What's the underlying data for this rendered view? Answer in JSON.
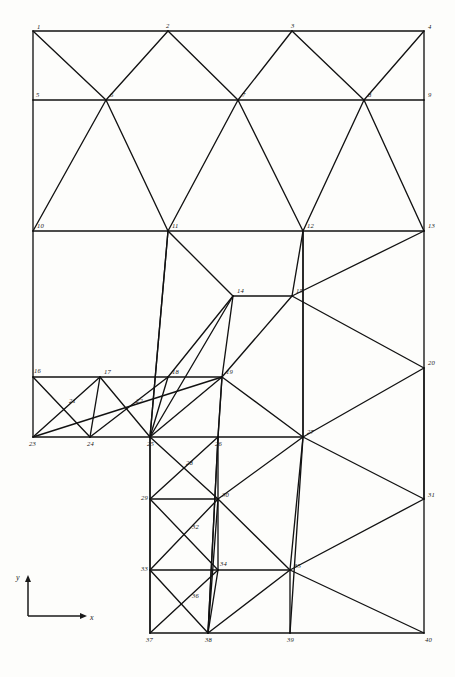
{
  "figure": {
    "kind": "finite-element-mesh-diagram",
    "line_color": "#121212",
    "label_color": "#151515",
    "background_color": "#fdfdfb",
    "canvas": {
      "width": 455,
      "height": 677
    }
  },
  "axes": {
    "origin": {
      "x": 28,
      "y": 616
    },
    "x_axis": {
      "label": "x",
      "tip_x": 86,
      "tip_y": 616
    },
    "y_axis": {
      "label": "y",
      "tip_x": 28,
      "tip_y": 576
    }
  },
  "nodes": [
    {
      "id": "1",
      "label": "1",
      "x": 33,
      "y": 31,
      "lx": 4,
      "ly": -2
    },
    {
      "id": "2",
      "label": "2",
      "x": 168,
      "y": 31,
      "lx": -2,
      "ly": -3
    },
    {
      "id": "3",
      "label": "3",
      "x": 292,
      "y": 31,
      "lx": -1,
      "ly": -3
    },
    {
      "id": "4",
      "label": "4",
      "x": 424,
      "y": 31,
      "lx": 4,
      "ly": -2
    },
    {
      "id": "5",
      "label": "5",
      "x": 33,
      "y": 100,
      "lx": 3,
      "ly": -3
    },
    {
      "id": "6",
      "label": "6",
      "x": 106,
      "y": 100,
      "lx": 4,
      "ly": -3
    },
    {
      "id": "7",
      "label": "7",
      "x": 238,
      "y": 100,
      "lx": 4,
      "ly": -3
    },
    {
      "id": "8",
      "label": "8",
      "x": 364,
      "y": 100,
      "lx": 4,
      "ly": -3
    },
    {
      "id": "9",
      "label": "9",
      "x": 424,
      "y": 100,
      "lx": 4,
      "ly": -3
    },
    {
      "id": "10",
      "label": "10",
      "x": 33,
      "y": 231,
      "lx": 4,
      "ly": -3
    },
    {
      "id": "11",
      "label": "11",
      "x": 168,
      "y": 231,
      "lx": 4,
      "ly": -3
    },
    {
      "id": "12",
      "label": "12",
      "x": 303,
      "y": 231,
      "lx": 4,
      "ly": -3
    },
    {
      "id": "13",
      "label": "13",
      "x": 424,
      "y": 231,
      "lx": 4,
      "ly": -3
    },
    {
      "id": "14",
      "label": "14",
      "x": 233,
      "y": 296,
      "lx": 4,
      "ly": -3
    },
    {
      "id": "15",
      "label": "15",
      "x": 292,
      "y": 296,
      "lx": 4,
      "ly": -3
    },
    {
      "id": "16",
      "label": "16",
      "x": 33,
      "y": 377,
      "lx": 1,
      "ly": -4
    },
    {
      "id": "17",
      "label": "17",
      "x": 100,
      "y": 377,
      "lx": 4,
      "ly": -3
    },
    {
      "id": "18",
      "label": "18",
      "x": 168,
      "y": 377,
      "lx": 4,
      "ly": -3
    },
    {
      "id": "19",
      "label": "19",
      "x": 222,
      "y": 377,
      "lx": 4,
      "ly": -3
    },
    {
      "id": "20",
      "label": "20",
      "x": 424,
      "y": 368,
      "lx": 4,
      "ly": -3
    },
    {
      "id": "21",
      "label": "21",
      "x": 67,
      "y": 406,
      "lx": 2,
      "ly": -3
    },
    {
      "id": "22",
      "label": "22",
      "x": 134,
      "y": 406,
      "lx": 2,
      "ly": -3
    },
    {
      "id": "23",
      "label": "23",
      "x": 33,
      "y": 437,
      "lx": -4,
      "ly": 9
    },
    {
      "id": "24",
      "label": "24",
      "x": 90,
      "y": 437,
      "lx": -3,
      "ly": 9
    },
    {
      "id": "25",
      "label": "25",
      "x": 150,
      "y": 437,
      "lx": -3,
      "ly": 9
    },
    {
      "id": "26",
      "label": "26",
      "x": 218,
      "y": 437,
      "lx": -3,
      "ly": 9
    },
    {
      "id": "27",
      "label": "27",
      "x": 303,
      "y": 437,
      "lx": 4,
      "ly": -3
    },
    {
      "id": "28",
      "label": "28",
      "x": 184,
      "y": 468,
      "lx": 2,
      "ly": -3
    },
    {
      "id": "29",
      "label": "29",
      "x": 150,
      "y": 499,
      "lx": -9,
      "ly": 1
    },
    {
      "id": "30",
      "label": "30",
      "x": 218,
      "y": 499,
      "lx": 4,
      "ly": -2
    },
    {
      "id": "31",
      "label": "31",
      "x": 424,
      "y": 499,
      "lx": 4,
      "ly": -2
    },
    {
      "id": "32",
      "label": "32",
      "x": 190,
      "y": 532,
      "lx": 2,
      "ly": -3
    },
    {
      "id": "33",
      "label": "33",
      "x": 150,
      "y": 570,
      "lx": -9,
      "ly": 1
    },
    {
      "id": "34",
      "label": "34",
      "x": 218,
      "y": 570,
      "lx": 2,
      "ly": -4
    },
    {
      "id": "35",
      "label": "35",
      "x": 290,
      "y": 570,
      "lx": 4,
      "ly": -2
    },
    {
      "id": "36",
      "label": "36",
      "x": 190,
      "y": 601,
      "lx": 2,
      "ly": -3
    },
    {
      "id": "37",
      "label": "37",
      "x": 150,
      "y": 633,
      "lx": -4,
      "ly": 9
    },
    {
      "id": "38",
      "label": "38",
      "x": 208,
      "y": 633,
      "lx": -3,
      "ly": 9
    },
    {
      "id": "39",
      "label": "39",
      "x": 290,
      "y": 633,
      "lx": -3,
      "ly": 9
    },
    {
      "id": "40",
      "label": "40",
      "x": 424,
      "y": 633,
      "lx": 1,
      "ly": 9
    }
  ],
  "edges": [
    [
      "1",
      "2"
    ],
    [
      "2",
      "3"
    ],
    [
      "3",
      "4"
    ],
    [
      "1",
      "5"
    ],
    [
      "5",
      "6"
    ],
    [
      "6",
      "7"
    ],
    [
      "7",
      "8"
    ],
    [
      "8",
      "9"
    ],
    [
      "4",
      "9"
    ],
    [
      "1",
      "6"
    ],
    [
      "2",
      "6"
    ],
    [
      "2",
      "7"
    ],
    [
      "3",
      "7"
    ],
    [
      "3",
      "8"
    ],
    [
      "4",
      "8"
    ],
    [
      "5",
      "10"
    ],
    [
      "9",
      "13"
    ],
    [
      "10",
      "11"
    ],
    [
      "11",
      "12"
    ],
    [
      "12",
      "13"
    ],
    [
      "6",
      "10"
    ],
    [
      "6",
      "11"
    ],
    [
      "7",
      "11"
    ],
    [
      "7",
      "12"
    ],
    [
      "8",
      "12"
    ],
    [
      "8",
      "13"
    ],
    [
      "10",
      "16"
    ],
    [
      "11",
      "14"
    ],
    [
      "11",
      "25"
    ],
    [
      "12",
      "15"
    ],
    [
      "12",
      "27"
    ],
    [
      "13",
      "15"
    ],
    [
      "13",
      "20"
    ],
    [
      "14",
      "15"
    ],
    [
      "14",
      "19"
    ],
    [
      "14",
      "18"
    ],
    [
      "15",
      "19"
    ],
    [
      "15",
      "20"
    ],
    [
      "16",
      "17"
    ],
    [
      "17",
      "18"
    ],
    [
      "18",
      "19"
    ],
    [
      "16",
      "23"
    ],
    [
      "16",
      "24"
    ],
    [
      "17",
      "23"
    ],
    [
      "17",
      "24"
    ],
    [
      "17",
      "25"
    ],
    [
      "18",
      "24"
    ],
    [
      "18",
      "25"
    ],
    [
      "19",
      "25"
    ],
    [
      "19",
      "26"
    ],
    [
      "19",
      "27"
    ],
    [
      "20",
      "27"
    ],
    [
      "20",
      "31"
    ],
    [
      "23",
      "24"
    ],
    [
      "24",
      "25"
    ],
    [
      "25",
      "26"
    ],
    [
      "26",
      "27"
    ],
    [
      "25",
      "29"
    ],
    [
      "25",
      "30"
    ],
    [
      "26",
      "29"
    ],
    [
      "26",
      "30"
    ],
    [
      "27",
      "30"
    ],
    [
      "27",
      "31"
    ],
    [
      "27",
      "35"
    ],
    [
      "29",
      "30"
    ],
    [
      "29",
      "34"
    ],
    [
      "30",
      "33"
    ],
    [
      "30",
      "34"
    ],
    [
      "30",
      "35"
    ],
    [
      "31",
      "35"
    ],
    [
      "31",
      "40"
    ],
    [
      "29",
      "33"
    ],
    [
      "30",
      "38"
    ],
    [
      "33",
      "34"
    ],
    [
      "34",
      "35"
    ],
    [
      "33",
      "37"
    ],
    [
      "33",
      "38"
    ],
    [
      "34",
      "37"
    ],
    [
      "34",
      "38"
    ],
    [
      "35",
      "38"
    ],
    [
      "35",
      "39"
    ],
    [
      "35",
      "40"
    ],
    [
      "37",
      "38"
    ],
    [
      "38",
      "39"
    ],
    [
      "39",
      "40"
    ],
    [
      "26",
      "38"
    ],
    [
      "19",
      "23"
    ],
    [
      "14",
      "25"
    ]
  ],
  "verticals": [
    {
      "from": "11",
      "to": "25"
    },
    {
      "from": "12",
      "to": "27"
    },
    {
      "from": "19",
      "to": "26"
    },
    {
      "from": "25",
      "to": "37"
    },
    {
      "from": "26",
      "to": "38"
    },
    {
      "from": "27",
      "to": "39"
    },
    {
      "from": "20",
      "to": "31"
    }
  ]
}
